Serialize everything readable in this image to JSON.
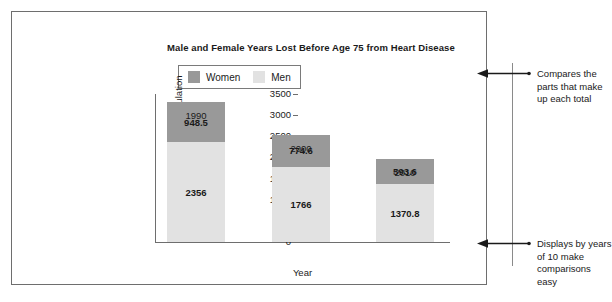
{
  "chart_data": {
    "type": "bar",
    "subtype": "stacked-bar",
    "title": "Male and Female Years Lost Before Age 75 from Heart Disease",
    "xlabel": "Year",
    "ylabel": "Rate per 100,000 population",
    "categories": [
      "1990",
      "2000",
      "2010"
    ],
    "series": [
      {
        "name": "Men",
        "values": [
          2356,
          1766,
          1370.8
        ],
        "color": "#e2e2e2",
        "labels": [
          "2356",
          "1766",
          "1370.8"
        ]
      },
      {
        "name": "Women",
        "values": [
          948.5,
          774.6,
          593.6
        ],
        "color": "#999999",
        "labels": [
          "948.5",
          "774.6",
          "593.6"
        ]
      }
    ],
    "stack_order": [
      "Men",
      "Women"
    ],
    "totals": [
      3304.5,
      2540.6,
      1964.4
    ],
    "ylim": [
      0,
      3500
    ],
    "yticks": [
      "0",
      "500",
      "1000",
      "1500",
      "2000",
      "2500",
      "3000",
      "3500"
    ],
    "ytick_values": [
      0,
      500,
      1000,
      1500,
      2000,
      2500,
      3000,
      3500
    ],
    "grid": false,
    "legend_position": "top-left-inside",
    "legend_entries": [
      "Women",
      "Men"
    ]
  },
  "annotations": {
    "top": "Compares the parts that make up each total",
    "bottom": "Displays by years of 10 make comparisons easy"
  },
  "icons": {
    "arrow_left": "left-arrow-icon"
  },
  "colors": {
    "women": "#999999",
    "men": "#e2e2e2",
    "axis": "#6e6e6e",
    "border": "#6e6e6e",
    "text": "#1a1a1a",
    "callout_line": "#8a8a8a"
  }
}
